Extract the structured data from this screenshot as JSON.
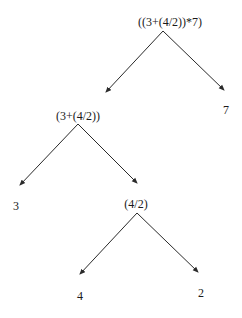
{
  "diagram": {
    "type": "expression-tree",
    "nodes": [
      {
        "id": "root",
        "label": "((3+(4/2))*7)",
        "x": 170,
        "y": 26,
        "apex": [
          163,
          31
        ]
      },
      {
        "id": "left1",
        "label": "(3+(4/2))",
        "x": 78,
        "y": 120,
        "apex": [
          78,
          124
        ]
      },
      {
        "id": "right1",
        "label": "7",
        "x": 226,
        "y": 114
      },
      {
        "id": "left2",
        "label": "3",
        "x": 16,
        "y": 210
      },
      {
        "id": "right2",
        "label": "(4/2)",
        "x": 136,
        "y": 208,
        "apex": [
          137,
          213
        ]
      },
      {
        "id": "left3",
        "label": "4",
        "x": 80,
        "y": 300
      },
      {
        "id": "right3",
        "label": "2",
        "x": 201,
        "y": 297
      }
    ],
    "edges": [
      {
        "from": "root",
        "to": "left1",
        "x1": 163,
        "y1": 31,
        "x2": 106,
        "y2": 92
      },
      {
        "from": "root",
        "to": "right1",
        "x1": 163,
        "y1": 31,
        "x2": 224,
        "y2": 90
      },
      {
        "from": "left1",
        "to": "left2",
        "x1": 78,
        "y1": 124,
        "x2": 20,
        "y2": 185
      },
      {
        "from": "left1",
        "to": "right2",
        "x1": 78,
        "y1": 124,
        "x2": 137,
        "y2": 183
      },
      {
        "from": "right2",
        "to": "left3",
        "x1": 137,
        "y1": 213,
        "x2": 80,
        "y2": 274
      },
      {
        "from": "right2",
        "to": "right3",
        "x1": 137,
        "y1": 213,
        "x2": 198,
        "y2": 272
      }
    ],
    "colors": {
      "background": "#ffffff",
      "edge": "#2a2a2a",
      "text": "#1a1a1a"
    }
  }
}
